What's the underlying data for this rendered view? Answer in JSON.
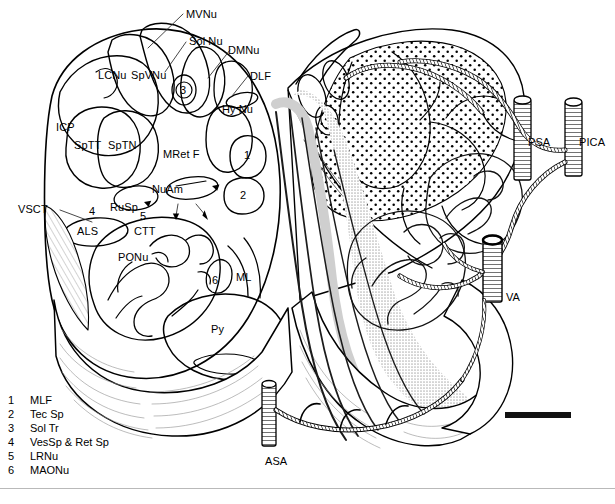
{
  "figure": {
    "background_color": "#ffffff",
    "ink_color": "#000000",
    "shade_color": "#d8d8d8",
    "stipple_color": "#000000",
    "width": 615,
    "height": 504
  },
  "labels": {
    "mvnu": "MVNu",
    "sol_nu": "Sol Nu",
    "dmnu": "DMNu",
    "dlf": "DLF",
    "lcnu": "LCNu",
    "spvnu": "SpVNu",
    "icp": "ICP",
    "hy_nu": "Hy Nu",
    "sptt": "SpTT",
    "sptn": "SpTN",
    "mret_f": "MRet F",
    "nuam": "NuAm",
    "rusp": "RuSp",
    "vsct": "VSCT",
    "als": "ALS",
    "ctt": "CTT",
    "ponu": "PONu",
    "ml": "ML",
    "py": "Py",
    "psa": "PSA",
    "pica": "PICA",
    "va": "VA",
    "asa": "ASA"
  },
  "callout_numbers": {
    "three": "3",
    "one": "1",
    "two": "2",
    "four": "4",
    "five": "5",
    "six": "6"
  },
  "legend": {
    "items": [
      {
        "num": "1",
        "label": "MLF"
      },
      {
        "num": "2",
        "label": "Tec Sp"
      },
      {
        "num": "3",
        "label": "Sol Tr"
      },
      {
        "num": "4",
        "label": "VesSp & Ret Sp"
      },
      {
        "num": "5",
        "label": "LRNu"
      },
      {
        "num": "6",
        "label": "MAONu"
      }
    ]
  },
  "scale_bar": {
    "present": "true"
  }
}
